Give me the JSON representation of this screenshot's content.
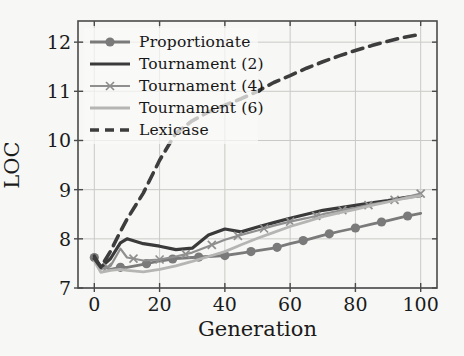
{
  "figure": {
    "background": "#f7f7f5",
    "frame_color": "#4a4a4a",
    "grid_color": "#c9c9c7",
    "text_color": "#1b1b1b"
  },
  "chart_data": {
    "type": "line",
    "title": "",
    "xlabel": "Generation",
    "ylabel": "LOC",
    "xlim": [
      -5,
      105
    ],
    "ylim": [
      7,
      12.43
    ],
    "xticks": [
      0,
      20,
      40,
      60,
      80,
      100
    ],
    "yticks": [
      7,
      8,
      9,
      10,
      11,
      12
    ],
    "grid": true,
    "legend_position": "upper-left",
    "x": [
      0,
      2,
      5,
      8,
      10,
      15,
      20,
      25,
      30,
      35,
      40,
      45,
      50,
      55,
      60,
      65,
      70,
      75,
      80,
      85,
      90,
      95,
      100
    ],
    "series": [
      {
        "name": "Proportionate",
        "color": "#7a7a7a",
        "style": "solid",
        "width": 2.8,
        "marker": "circle",
        "marker_every": 8,
        "marker_offset": 0,
        "values": [
          7.62,
          7.45,
          7.38,
          7.42,
          7.42,
          7.48,
          7.55,
          7.6,
          7.62,
          7.64,
          7.66,
          7.71,
          7.76,
          7.81,
          7.9,
          7.98,
          8.07,
          8.15,
          8.22,
          8.3,
          8.37,
          8.45,
          8.52
        ]
      },
      {
        "name": "Tournament (2)",
        "color": "#3a3a3a",
        "style": "solid",
        "width": 3.2,
        "marker": "none",
        "marker_every": 0,
        "marker_offset": 0,
        "values": [
          7.65,
          7.42,
          7.6,
          7.92,
          8.0,
          7.9,
          7.85,
          7.78,
          7.81,
          8.08,
          8.2,
          8.14,
          8.24,
          8.33,
          8.42,
          8.5,
          8.58,
          8.63,
          8.68,
          8.73,
          8.78,
          8.84,
          8.88
        ]
      },
      {
        "name": "Tournament (4)",
        "color": "#8f8f8f",
        "style": "solid",
        "width": 2.2,
        "marker": "x",
        "marker_every": 8,
        "marker_offset": 4,
        "values": [
          7.6,
          7.38,
          7.45,
          7.8,
          7.62,
          7.56,
          7.58,
          7.64,
          7.72,
          7.85,
          7.98,
          8.08,
          8.17,
          8.27,
          8.35,
          8.42,
          8.5,
          8.57,
          8.63,
          8.7,
          8.76,
          8.84,
          8.92
        ]
      },
      {
        "name": "Tournament (6)",
        "color": "#b5b5b3",
        "style": "solid",
        "width": 2.8,
        "marker": "none",
        "marker_every": 0,
        "marker_offset": 0,
        "values": [
          7.55,
          7.32,
          7.36,
          7.38,
          7.36,
          7.33,
          7.38,
          7.45,
          7.54,
          7.64,
          7.74,
          7.88,
          8.01,
          8.13,
          8.25,
          8.35,
          8.45,
          8.53,
          8.6,
          8.68,
          8.75,
          8.82,
          8.88
        ]
      },
      {
        "name": "Lexicase",
        "color": "#3d3d3d",
        "style": "dashed",
        "width": 3.6,
        "marker": "none",
        "marker_every": 0,
        "marker_offset": 0,
        "values": [
          7.6,
          7.42,
          7.75,
          8.15,
          8.4,
          8.93,
          9.6,
          10.15,
          10.4,
          10.58,
          10.72,
          10.85,
          11.0,
          11.18,
          11.32,
          11.47,
          11.6,
          11.72,
          11.83,
          11.93,
          12.02,
          12.1,
          12.16
        ]
      }
    ]
  }
}
